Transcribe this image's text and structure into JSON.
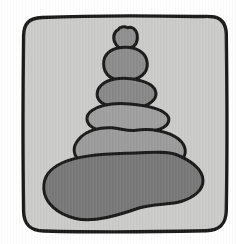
{
  "illustration": {
    "subject": "Hand-drawn cairn of six stacked rounded stones on a light gray rounded-square panel",
    "colors": {
      "canvas": "#ffffff",
      "panel": "#cbcbca",
      "outline": "#1a1a1a"
    },
    "stones": [
      {
        "name": "stone-top-tiny",
        "color": "#8f8f8f"
      },
      {
        "name": "stone-2-round",
        "color": "#8c8c8c"
      },
      {
        "name": "stone-3-oval",
        "color": "#888888"
      },
      {
        "name": "stone-4-wide",
        "color": "#9f9f9f"
      },
      {
        "name": "stone-5-wider",
        "color": "#9b9b9b"
      },
      {
        "name": "stone-6-base",
        "color": "#787878"
      }
    ]
  }
}
